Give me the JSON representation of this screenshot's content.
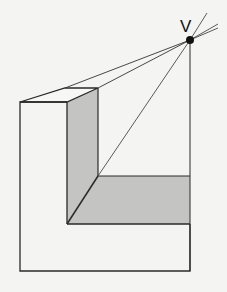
{
  "diagram": {
    "type": "one-point perspective drawing",
    "vanishing_point_label": "V",
    "colors": {
      "background": "#f4f4f2",
      "stroke": "#2a2a2a",
      "shade": "#c4c4c2",
      "face": "#f7f7f5"
    }
  }
}
